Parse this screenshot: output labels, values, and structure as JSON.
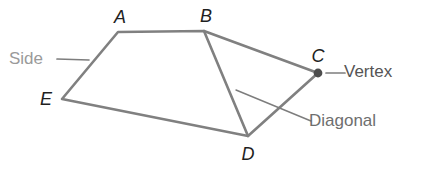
{
  "figure": {
    "colors": {
      "background": "#ffffff",
      "polygon_stroke": "#808080",
      "diagonal_stroke": "#808080",
      "leader_line": "#7d7d7d",
      "vertex_dot": "#4d4d4d",
      "vertex_letter_text": "#1f1f1f",
      "side_label_text": "#9a9a9a",
      "vertex_label_text": "#555555",
      "diagonal_label_text": "#6e6e6e"
    },
    "stroke_width": 2.6,
    "vertices": [
      {
        "id": "A",
        "label": "A",
        "x": 118,
        "y": 32,
        "label_x": 120,
        "label_y": 17,
        "dot": false
      },
      {
        "id": "B",
        "label": "B",
        "x": 204,
        "y": 31,
        "label_x": 206,
        "label_y": 16,
        "dot": false
      },
      {
        "id": "C",
        "label": "C",
        "x": 318,
        "y": 73,
        "label_x": 318,
        "label_y": 56,
        "dot": true
      },
      {
        "id": "D",
        "label": "D",
        "x": 248,
        "y": 136,
        "label_x": 248,
        "label_y": 154,
        "dot": false
      },
      {
        "id": "E",
        "label": "E",
        "x": 62,
        "y": 99,
        "label_x": 46,
        "label_y": 99,
        "dot": false
      }
    ],
    "edges": [
      {
        "from": "A",
        "to": "B",
        "kind": "side"
      },
      {
        "from": "B",
        "to": "C",
        "kind": "side"
      },
      {
        "from": "C",
        "to": "D",
        "kind": "side"
      },
      {
        "from": "D",
        "to": "E",
        "kind": "side"
      },
      {
        "from": "E",
        "to": "A",
        "kind": "side"
      }
    ],
    "diagonals": [
      {
        "from": "B",
        "to": "D",
        "kind": "diagonal"
      }
    ],
    "vertex_dot_radius": 4.4,
    "polygon_path": "M 118 32 L 204 31 L 318 73 L 248 136 L 62 99 Z",
    "diagonal_path": "M 204 31 L 248 136",
    "callouts": [
      {
        "id": "side",
        "label": "Side",
        "leader": {
          "x1": 57,
          "y1": 59,
          "x2": 89,
          "y2": 60
        }
      },
      {
        "id": "vertex",
        "label": "Vertex",
        "leader": {
          "x1": 326,
          "y1": 73,
          "x2": 345,
          "y2": 73
        }
      },
      {
        "id": "diagonal",
        "label": "Diagonal",
        "leader": {
          "x1": 236,
          "y1": 90,
          "x2": 311,
          "y2": 121
        }
      }
    ]
  }
}
